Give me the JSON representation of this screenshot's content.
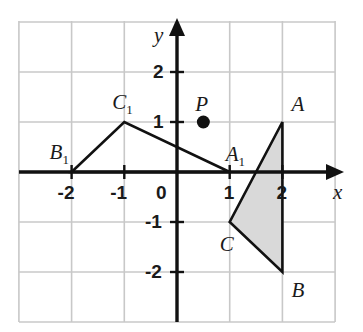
{
  "figure": {
    "background_color": "#ffffff",
    "grid_color": "#c8c8c8",
    "axis_color": "#111111",
    "shape_stroke_color": "#111111",
    "shaded_fill_color": "#d9d9d9"
  },
  "axes": {
    "x_label": "x",
    "y_label": "y",
    "origin_label": "0",
    "x_ticks": [
      {
        "value": -2,
        "label": "-2"
      },
      {
        "value": -1,
        "label": "-1"
      },
      {
        "value": 1,
        "label": "1"
      },
      {
        "value": 2,
        "label": "2"
      }
    ],
    "y_ticks": [
      {
        "value": 2,
        "label": "2"
      },
      {
        "value": 1,
        "label": "1"
      },
      {
        "value": -1,
        "label": "-1"
      },
      {
        "value": -2,
        "label": "-2"
      }
    ],
    "x_range": [
      -3,
      3
    ],
    "y_range": [
      -3,
      3
    ],
    "grid": true
  },
  "chart_data": {
    "type": "scatter",
    "xlabel": "x",
    "ylabel": "y",
    "xlim": [
      -3,
      3
    ],
    "ylim": [
      -3,
      3
    ],
    "grid": true,
    "shapes": [
      {
        "name": "triangle-ABC",
        "filled": true,
        "fill": "#d9d9d9",
        "vertices": [
          {
            "label": "A",
            "x": 2,
            "y": 1
          },
          {
            "label": "B",
            "x": 2,
            "y": -2
          },
          {
            "label": "C",
            "x": 1,
            "y": -1
          }
        ]
      },
      {
        "name": "triangle-A1B1C1",
        "filled": false,
        "fill": "none",
        "vertices": [
          {
            "label": "A1",
            "x": 1,
            "y": 0
          },
          {
            "label": "B1",
            "x": -2,
            "y": 0
          },
          {
            "label": "C1",
            "x": -1,
            "y": 1
          }
        ]
      }
    ],
    "points": [
      {
        "label": "P",
        "x": 0.5,
        "y": 1,
        "marker": "filled-circle"
      }
    ]
  },
  "labels": {
    "A": "A",
    "B": "B",
    "C": "C",
    "A1_base": "A",
    "A1_sub": "1",
    "B1_base": "B",
    "B1_sub": "1",
    "C1_base": "C",
    "C1_sub": "1",
    "P": "P"
  }
}
